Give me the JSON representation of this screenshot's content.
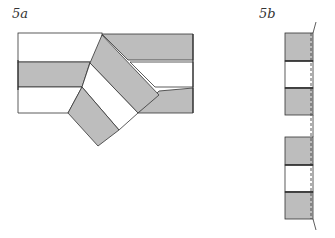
{
  "figure_a": {
    "label": "5a",
    "fill_gray": "#bdbdbd",
    "fill_white": "#ffffff",
    "stroke": "#333333"
  },
  "figure_b": {
    "label": "5b",
    "fill_gray": "#bdbdbd",
    "fill_white": "#ffffff",
    "stroke": "#333333"
  }
}
